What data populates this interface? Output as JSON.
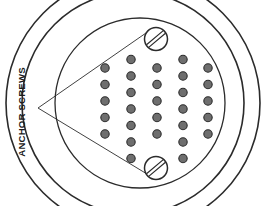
{
  "diagram": {
    "type": "technical-line-drawing",
    "background_color": "#ffffff",
    "line_color": "#2b2b2b",
    "dot_fill_color": "#6e6e6e",
    "dot_stroke_color": "#2b2b2b",
    "screw_fill_color": "#ffffff"
  },
  "label": {
    "text": "ANCHOR SCREWS",
    "rotation_degrees": -90,
    "x": 22,
    "y": 112,
    "color": "#1a1a1a"
  },
  "circles": [
    {
      "name": "outer-ring",
      "cx": 133,
      "cy": 103,
      "r": 127,
      "stroke_width": 1.6
    },
    {
      "name": "middle-ring",
      "cx": 133,
      "cy": 103,
      "r": 111,
      "stroke_width": 1.6
    },
    {
      "name": "inner-plate",
      "cx": 140,
      "cy": 103,
      "r": 85,
      "stroke_width": 1.3
    }
  ],
  "screws": [
    {
      "name": "anchor-screw-top",
      "cx": 156,
      "cy": 39,
      "r": 11.5,
      "slot_angle_degrees": -40
    },
    {
      "name": "anchor-screw-bottom",
      "cx": 156,
      "cy": 168,
      "r": 11.5,
      "slot_angle_degrees": -40
    }
  ],
  "leader_lines": [
    {
      "name": "leader-to-top-screw",
      "x1": 38,
      "y1": 108,
      "x2": 146,
      "y2": 33
    },
    {
      "name": "leader-to-bottom-screw",
      "x1": 38,
      "y1": 108,
      "x2": 147,
      "y2": 174
    }
  ],
  "dot_grid": {
    "dot_radius": 4.2,
    "columns": [
      {
        "name": "dot-column-1",
        "x": 105,
        "count": 5,
        "y_start": 68,
        "y_step": 16.5
      },
      {
        "name": "dot-column-2",
        "x": 131,
        "count": 7,
        "y_start": 59.5,
        "y_step": 16.5
      },
      {
        "name": "dot-column-3",
        "x": 157,
        "count": 5,
        "y_start": 68,
        "y_step": 16.5
      },
      {
        "name": "dot-column-4",
        "x": 183,
        "count": 7,
        "y_start": 59.5,
        "y_step": 16.5
      },
      {
        "name": "dot-column-5",
        "x": 208,
        "count": 5,
        "y_start": 68,
        "y_step": 16.5
      }
    ]
  }
}
